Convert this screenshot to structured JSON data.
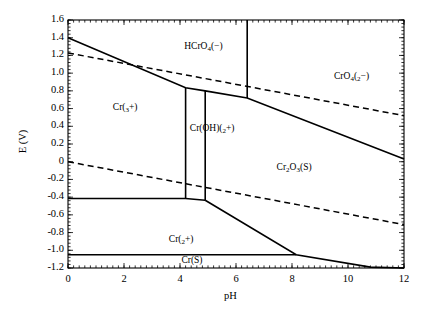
{
  "chart_data": {
    "type": "line",
    "title": "",
    "xlabel": "pH",
    "ylabel": "E (V)",
    "xlim": [
      0,
      12
    ],
    "ylim": [
      -1.2,
      1.6
    ],
    "xticks": [
      "0",
      "2",
      "4",
      "6",
      "8",
      "10",
      "12"
    ],
    "xtick_values": [
      0,
      2,
      4,
      6,
      8,
      10,
      12
    ],
    "yticks": [
      "1.6",
      "1.4",
      "1.2",
      "1.0",
      "0.8",
      "0.6",
      "0.4",
      "0.2",
      "0",
      "-0.2",
      "-0.4",
      "-0.6",
      "-0.8",
      "-1.0",
      "-1.2"
    ],
    "ytick_values": [
      1.6,
      1.4,
      1.2,
      1.0,
      0.8,
      0.6,
      0.4,
      0.2,
      0,
      -0.2,
      -0.4,
      -0.6,
      -0.8,
      -1.0,
      -1.2
    ],
    "grid": false,
    "legend": "none",
    "minor_ticks": true,
    "line_color": "#000000",
    "background": "#ffffff",
    "region_labels": [
      {
        "id": "hcro4",
        "text": "HCrO4(-)",
        "html": "HCrO<sub>4</sub>(&#8722;)",
        "ph": 4.15,
        "e": 1.28
      },
      {
        "id": "cro4",
        "text": "CrO4(2-)",
        "html": "CrO<sub>4</sub>(<sub>2</sub>&#8722;)",
        "ph": 9.5,
        "e": 0.95
      },
      {
        "id": "cr3plus",
        "text": "Cr(3+)",
        "html": "Cr(<sub>3</sub>+)",
        "ph": 1.6,
        "e": 0.6
      },
      {
        "id": "croh2plus",
        "text": "Cr(OH)(2+)",
        "html": "Cr(OH)(<sub>2</sub>+)",
        "ph": 4.35,
        "e": 0.36
      },
      {
        "id": "cr2o3",
        "text": "Cr2O3(S)",
        "html": "Cr<sub>2</sub>O<sub>3</sub>(S)",
        "ph": 7.45,
        "e": -0.08
      },
      {
        "id": "cr2plus",
        "text": "Cr(2+)",
        "html": "Cr(<sub>2</sub>+)",
        "ph": 3.6,
        "e": -0.9
      },
      {
        "id": "crs",
        "text": "Cr(S)",
        "html": "Cr(S)",
        "ph": 4.05,
        "e": -1.13
      }
    ],
    "series": [
      {
        "name": "water-upper-stability-line",
        "style": "dashed",
        "points": [
          [
            0,
            1.228
          ],
          [
            12,
            0.52
          ]
        ]
      },
      {
        "name": "water-lower-stability-line",
        "style": "dashed",
        "points": [
          [
            0,
            0.0
          ],
          [
            12,
            -0.71
          ]
        ]
      },
      {
        "name": "hcro4-cr3-boundary",
        "style": "solid",
        "points": [
          [
            0,
            1.4
          ],
          [
            4.2,
            0.835
          ],
          [
            4.9,
            0.8
          ],
          [
            6.4,
            0.72
          ],
          [
            12,
            0.03
          ]
        ]
      },
      {
        "name": "cr3-croh2-vertical",
        "style": "solid",
        "points": [
          [
            4.2,
            0.835
          ],
          [
            4.2,
            -0.415
          ]
        ]
      },
      {
        "name": "croh2-cr2o3-vertical",
        "style": "solid",
        "points": [
          [
            4.9,
            0.8
          ],
          [
            4.9,
            -0.435
          ]
        ]
      },
      {
        "name": "hcro4-cro4-vertical",
        "style": "solid",
        "points": [
          [
            6.4,
            1.6
          ],
          [
            6.4,
            0.72
          ]
        ]
      },
      {
        "name": "cr3-cr2-horizontal",
        "style": "solid",
        "points": [
          [
            0,
            -0.415
          ],
          [
            4.2,
            -0.415
          ],
          [
            4.9,
            -0.435
          ]
        ]
      },
      {
        "name": "cr2o3-cr2-boundary",
        "style": "solid",
        "points": [
          [
            4.9,
            -0.435
          ],
          [
            8.15,
            -1.05
          ],
          [
            10.8,
            -1.19
          ],
          [
            12,
            -1.2
          ]
        ]
      },
      {
        "name": "cr2-crs-horizontal",
        "style": "solid",
        "points": [
          [
            0,
            -1.05
          ],
          [
            8.15,
            -1.05
          ]
        ]
      }
    ]
  },
  "axis": {
    "x_title": "pH",
    "y_title": "E (V)"
  }
}
